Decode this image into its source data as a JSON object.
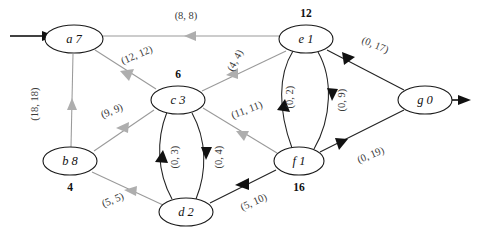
{
  "diagram": {
    "type": "flow-network-residual-graph",
    "nodes": [
      {
        "id": "a",
        "value": "7",
        "text": "a 7",
        "label": "",
        "label_pos": "none",
        "cx": 74,
        "cy": 39,
        "rx": 29,
        "ry": 14
      },
      {
        "id": "b",
        "value": "8",
        "text": "b 8",
        "label": "4",
        "label_pos": "below",
        "cx": 70,
        "cy": 161,
        "rx": 27,
        "ry": 14
      },
      {
        "id": "c",
        "value": "3",
        "text": "c 3",
        "label": "6",
        "label_pos": "above",
        "cx": 178,
        "cy": 100,
        "rx": 27,
        "ry": 14
      },
      {
        "id": "d",
        "value": "2",
        "text": "d 2",
        "label": "",
        "label_pos": "none",
        "cx": 186,
        "cy": 212,
        "rx": 27,
        "ry": 14
      },
      {
        "id": "e",
        "value": "1",
        "text": "e 1",
        "label": "12",
        "label_pos": "above",
        "cx": 306,
        "cy": 39,
        "rx": 27,
        "ry": 14
      },
      {
        "id": "f",
        "value": "1",
        "text": "f 1",
        "label": "16",
        "label_pos": "below",
        "cx": 299,
        "cy": 161,
        "rx": 25,
        "ry": 14
      },
      {
        "id": "g",
        "value": "0",
        "text": "g 0",
        "label": "",
        "label_pos": "none",
        "cx": 425,
        "cy": 100,
        "rx": 27,
        "ry": 14
      }
    ],
    "edges": [
      {
        "from": "e",
        "to": "a",
        "label": "(8, 8)",
        "color": "gray"
      },
      {
        "from": "c",
        "to": "a",
        "label": "(12, 12)",
        "color": "gray"
      },
      {
        "from": "b",
        "to": "a",
        "label": "(18, 18)",
        "color": "gray"
      },
      {
        "from": "e",
        "to": "c",
        "label": "(4, 4)",
        "color": "gray"
      },
      {
        "from": "c",
        "to": "b",
        "label": "(9, 9)",
        "color": "gray"
      },
      {
        "from": "f",
        "to": "c",
        "label": "(11, 11)",
        "color": "gray"
      },
      {
        "from": "d",
        "to": "b",
        "label": "(5, 5)",
        "color": "gray"
      },
      {
        "from": "f",
        "to": "d",
        "label": "(5, 10)",
        "color": "black"
      },
      {
        "from": "f",
        "to": "e",
        "label": "(0, 2)",
        "color": "black"
      },
      {
        "from": "e",
        "to": "f",
        "label": "(0, 9)",
        "color": "black"
      },
      {
        "from": "d",
        "to": "c",
        "label": "(0, 3)",
        "color": "black"
      },
      {
        "from": "c",
        "to": "d",
        "label": "(0, 4)",
        "color": "black"
      },
      {
        "from": "e",
        "to": "g",
        "label": "(0, 17)",
        "color": "black"
      },
      {
        "from": "f",
        "to": "g",
        "label": "(0, 19)",
        "color": "black"
      }
    ],
    "terminals": {
      "source_arrow": "incoming-arrow-into-a",
      "sink_arrow": "outgoing-arrow-from-g"
    }
  }
}
